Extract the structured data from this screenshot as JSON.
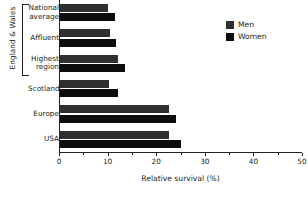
{
  "chart_data": {
    "type": "bar",
    "orientation": "horizontal",
    "title": "",
    "xlabel": "Relative survival (%)",
    "ylabel": "",
    "xlim": [
      0,
      50
    ],
    "xticks": [
      0,
      10,
      20,
      30,
      40,
      50
    ],
    "xtick_labels": [
      "0",
      "10",
      "20",
      "30",
      "40",
      "50"
    ],
    "minor_xticks": [
      5,
      15,
      25,
      35,
      45
    ],
    "grid": false,
    "legend_position": "top-right",
    "categories": [
      "National average",
      "Affluent",
      "Highest region",
      "Scotland",
      "Europe",
      "USA"
    ],
    "category_lines": [
      [
        "National",
        "average"
      ],
      [
        "Affluent"
      ],
      [
        "Highest",
        "region"
      ],
      [
        "Scotland"
      ],
      [
        "Europe"
      ],
      [
        "USA"
      ]
    ],
    "series": [
      {
        "name": "Men",
        "color": "#2f2f2f",
        "values": [
          9.9,
          10.3,
          11.9,
          10.1,
          22.4,
          22.4
        ]
      },
      {
        "name": "Women",
        "color": "#0d0d0d",
        "values": [
          11.3,
          11.5,
          13.4,
          11.9,
          23.9,
          24.9
        ]
      }
    ],
    "group_bracket_label": "England & Wales",
    "group_bracket_categories": [
      "National average",
      "Affluent",
      "Highest region"
    ]
  },
  "legend": {
    "items": [
      {
        "label": "Men",
        "color": "#2f2f2f"
      },
      {
        "label": "Women",
        "color": "#0d0d0d"
      }
    ]
  },
  "axis": {
    "x_title": "Relative survival (%)"
  },
  "group": {
    "label": "England & Wales"
  }
}
